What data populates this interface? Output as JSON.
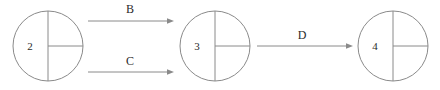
{
  "figure": {
    "type": "state-transition-diagram",
    "background_color": "#ffffff",
    "stroke_color": "#8a8a8a",
    "text_color": "#2b2b2b",
    "width": 440,
    "height": 90
  },
  "nodes": [
    {
      "id": "node-2",
      "label": "2",
      "cx": 48,
      "cy": 46,
      "r": 35,
      "label_x": 30,
      "label_y": 47,
      "glyph": "circle-with-vertical-diameter-and-right-radius"
    },
    {
      "id": "node-3",
      "label": "3",
      "cx": 215,
      "cy": 46,
      "r": 35,
      "label_x": 197,
      "label_y": 47,
      "glyph": "circle-with-vertical-diameter-and-right-radius"
    },
    {
      "id": "node-4",
      "label": "4",
      "cx": 393,
      "cy": 46,
      "r": 35,
      "label_x": 375,
      "label_y": 47,
      "glyph": "circle-with-vertical-diameter-and-right-radius"
    }
  ],
  "edges": [
    {
      "id": "edge-b",
      "label": "B",
      "from": "node-2",
      "to": "node-3",
      "x1": 88,
      "x2": 174,
      "y": 21,
      "label_x": 130,
      "label_y": 10
    },
    {
      "id": "edge-c",
      "label": "C",
      "from": "node-2",
      "to": "node-3",
      "x1": 88,
      "x2": 174,
      "y": 72,
      "label_x": 130,
      "label_y": 62
    },
    {
      "id": "edge-d",
      "label": "D",
      "from": "node-3",
      "to": "node-4",
      "x1": 257,
      "x2": 353,
      "y": 46,
      "label_x": 302,
      "label_y": 36
    }
  ]
}
